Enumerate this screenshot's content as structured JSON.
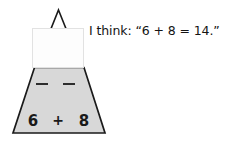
{
  "page": {
    "width": 248,
    "height": 142,
    "background_color": "#ffffff"
  },
  "diagram": {
    "name": "math-mountain-triangle",
    "shape": "triangle",
    "fill_color": "#d8d8d8",
    "stroke_color": "#1a1a1a",
    "apex_label": "",
    "blanks": [
      {
        "label": "–"
      },
      {
        "label": "–"
      }
    ],
    "bottom_row": {
      "left_addend": "6",
      "operator": "+",
      "right_addend": "8"
    }
  },
  "cover_box": {
    "label": "",
    "fill_color": "#fdfdfd",
    "border_color": "#e2e2e2"
  },
  "annotation": {
    "text": "I think: “6 + 8 = 14.”",
    "color": "#141414"
  }
}
